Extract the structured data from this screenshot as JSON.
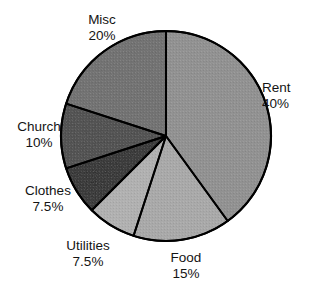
{
  "chart_data": {
    "type": "pie",
    "title": "",
    "subtitle": "",
    "xlabel": "",
    "ylabel": "",
    "legend_position": "none",
    "grid": false,
    "start_angle_deg": 0,
    "direction": "clockwise",
    "center": {
      "x": 166,
      "y": 136
    },
    "radius": 105,
    "outline_color": "#000000",
    "background_color": "#ffffff",
    "categories": [
      "Rent",
      "Food",
      "Utilities",
      "Clothes",
      "Church",
      "Misc"
    ],
    "values": [
      40,
      15,
      7.5,
      7.5,
      10,
      20
    ],
    "value_suffix": "%",
    "slices": [
      {
        "label": "Rent",
        "value": 40,
        "value_text": "40%",
        "color": "#8f8f8f",
        "start_deg": 0,
        "end_deg": 144,
        "label_position": "right"
      },
      {
        "label": "Food",
        "value": 15,
        "value_text": "15%",
        "color": "#a8a8a8",
        "start_deg": 144,
        "end_deg": 198,
        "label_position": "bottom"
      },
      {
        "label": "Utilities",
        "value": 7.5,
        "value_text": "7.5%",
        "color": "#b0b0b0",
        "start_deg": 198,
        "end_deg": 225,
        "label_position": "bottom-left"
      },
      {
        "label": "Clothes",
        "value": 7.5,
        "value_text": "7.5%",
        "color": "#2b2b2b",
        "start_deg": 225,
        "end_deg": 252,
        "label_position": "left-lower"
      },
      {
        "label": "Church",
        "value": 10,
        "value_text": "10%",
        "color": "#4a4a4a",
        "start_deg": 252,
        "end_deg": 288,
        "label_position": "left"
      },
      {
        "label": "Misc",
        "value": 20,
        "value_text": "20%",
        "color": "#6e6e6e",
        "start_deg": 288,
        "end_deg": 360,
        "label_position": "top-left"
      }
    ]
  },
  "labels": {
    "misc": {
      "name": "Misc",
      "value": "20%"
    },
    "rent": {
      "name": "Rent",
      "value": "40%"
    },
    "church": {
      "name": "Church",
      "value": "10%"
    },
    "clothes": {
      "name": "Clothes",
      "value": "7.5%"
    },
    "utilities": {
      "name": "Utilities",
      "value": "7.5%"
    },
    "food": {
      "name": "Food",
      "value": "15%"
    }
  }
}
